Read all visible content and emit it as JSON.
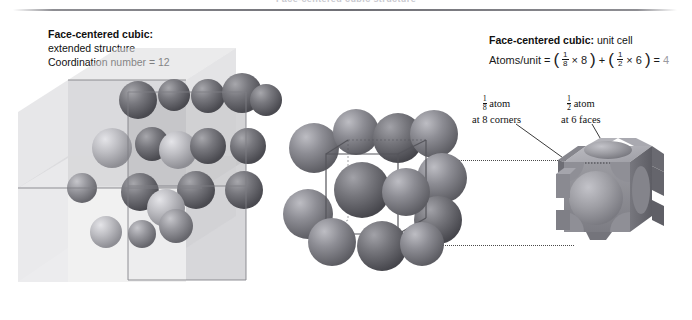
{
  "page": {
    "running_head": "Face-centered cubic structure",
    "background": "#ffffff",
    "width": 692,
    "height": 320
  },
  "caption_left": {
    "title": "Face-centered cubic:",
    "line2": "extended structure",
    "line3": "Coordination number = 12"
  },
  "caption_right": {
    "title": "Face-centered cubic:",
    "title_suffix": " unit cell",
    "equation_label": "Atoms/unit",
    "equals": "=",
    "term1_num": "1",
    "term1_den": "8",
    "term1_times": "×",
    "term1_count": "8",
    "plus": "+",
    "term2_num": "1",
    "term2_den": "2",
    "term2_times": "×",
    "term2_count": "6",
    "equals2": "=",
    "result": "4"
  },
  "callouts": {
    "corner": {
      "frac_num": "1",
      "frac_den": "8",
      "word": "atom",
      "line2": "at 8 corners"
    },
    "face": {
      "frac_num": "1",
      "frac_den": "2",
      "word": "atom",
      "line2": "at 6 faces"
    }
  },
  "artwork": {
    "extended_structure_name": "face-centered-cubic-extended-structure",
    "unit_cell_name": "face-centered-cubic-unit-cell",
    "fractional_atoms_name": "fractional-atom-cube"
  },
  "colors": {
    "rule": "#6f6f75",
    "sphere_dark": "#6b6b70",
    "sphere_mid": "#8c8c91",
    "sphere_light": "#b8b8bd",
    "box_face_light": "#e3e3e5",
    "box_face_mid": "#cfcfd2",
    "box_face_dark": "#bdbdc1",
    "leader": "#3a3a3a",
    "dotted": "#4a4a4a",
    "result_gray": "#9a9a9f"
  }
}
